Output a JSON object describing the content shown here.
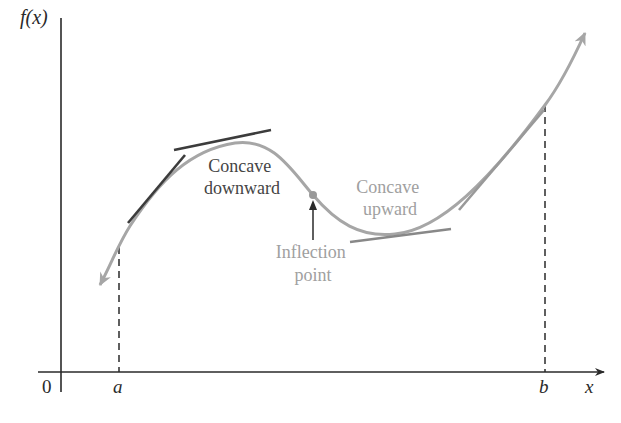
{
  "figure": {
    "y_axis_label": "f(x)",
    "x_axis_label": "x",
    "origin_label": "0",
    "a_label": "a",
    "b_label": "b",
    "concave_down_label": [
      "Concave",
      "downward"
    ],
    "concave_up_label": [
      "Concave",
      "upward"
    ],
    "inflection_label": [
      "Inflection",
      "point"
    ]
  },
  "colors": {
    "curve": "#a6a6a6",
    "tangent_dark": "#3c3c3c",
    "axis": "#2a2a2a",
    "text_dark": "#444444",
    "text_light": "#a0a0a0"
  }
}
